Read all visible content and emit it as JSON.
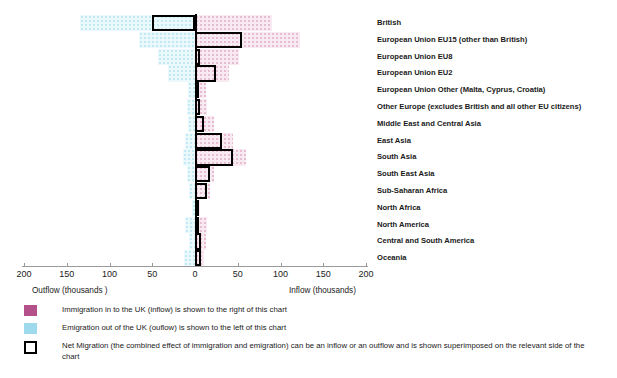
{
  "chart_data": {
    "type": "bar",
    "title": "",
    "orientation": "horizontal",
    "xlabel_left": "Outflow  (thousands )",
    "xlabel_right": "Inflow (thousands)",
    "axis": {
      "ticks": [
        200,
        150,
        100,
        50,
        0,
        50,
        100,
        150,
        200
      ],
      "tick_labels": [
        "200",
        "150",
        "100",
        "50",
        "0",
        "50",
        "100",
        "150",
        "200"
      ],
      "xlim": [
        -200,
        200
      ],
      "grid": false,
      "units": "thousands"
    },
    "categories": [
      "British",
      "European Union EU15 (other than British)",
      "European Union EU8",
      "European Union EU2",
      "European Union Other (Malta, Cyprus, Croatia)",
      "Other Europe (excludes British and all other EU citizens)",
      "Middle East and Central Asia",
      "East Asia",
      "South Asia",
      "South East Asia",
      "Sub-Saharan Africa",
      "North Africa",
      "North America",
      "Central and South America",
      "Oceania"
    ],
    "series": [
      {
        "name": "Immigration in to the UK (inflow)",
        "color": "#b4508a",
        "side": "right",
        "values": [
          90,
          123,
          52,
          40,
          13,
          14,
          22,
          45,
          60,
          22,
          18,
          6,
          14,
          13,
          10
        ]
      },
      {
        "name": "Emigration out of the UK (outflow)",
        "color": "#9fd9ee",
        "side": "left",
        "values": [
          135,
          65,
          43,
          32,
          8,
          9,
          8,
          12,
          14,
          9,
          7,
          3,
          12,
          7,
          13
        ]
      },
      {
        "name": "Net Migration",
        "color": "#000000",
        "side": "either",
        "values": [
          -50,
          55,
          6,
          25,
          3,
          6,
          11,
          32,
          45,
          17,
          14,
          4,
          5,
          7,
          7
        ]
      }
    ],
    "legend": {
      "position": "below",
      "entries": [
        {
          "swatch": "inflow",
          "text": "Immigration in to the UK (inflow) is shown to the right of this chart"
        },
        {
          "swatch": "outflow",
          "text": "Emigration out of the UK (ouflow) is shown to the left of this chart"
        },
        {
          "swatch": "net",
          "text": "Net Migration (the combined effect of immigration and emigration) can be an inflow or an outflow and is shown superimposed on the relevant side of the chart"
        }
      ]
    },
    "colors": {
      "inflow": "#b4508a",
      "outflow": "#9fd9ee",
      "net_outline": "#000000",
      "axis": "#9a9a9a",
      "background": "#ffffff"
    }
  }
}
